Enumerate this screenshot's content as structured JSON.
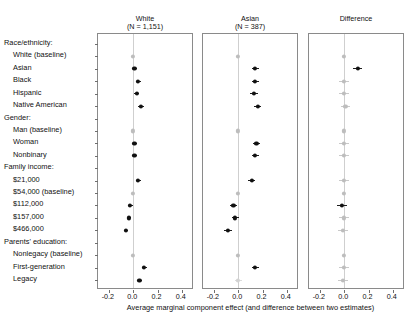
{
  "figure": {
    "x_axis_caption": "Average marginal component effect (and difference between two estimates)",
    "x_ticks": [
      "-0.2",
      "0.0",
      "0.2",
      "0.4"
    ],
    "x_tick_values": [
      -0.2,
      0.0,
      0.2,
      0.4
    ],
    "colors": {
      "dark_estimate": "#111111",
      "light_estimate": "#bdbdbd",
      "panel_border": "#8a8a8a",
      "zero_line": "#cfcfcf",
      "background": "#ffffff"
    }
  },
  "panels": [
    {
      "title_main": "White",
      "title_sub": "(N = 1,151)"
    },
    {
      "title_main": "Asian",
      "title_sub": "(N = 387)"
    },
    {
      "title_main": "Difference",
      "title_sub": ""
    }
  ],
  "rows": [
    {
      "label": "Race/ethnicity:",
      "type": "header"
    },
    {
      "label": "White (baseline)",
      "type": "item"
    },
    {
      "label": "Asian",
      "type": "item"
    },
    {
      "label": "Black",
      "type": "item"
    },
    {
      "label": "Hispanic",
      "type": "item"
    },
    {
      "label": "Native American",
      "type": "item"
    },
    {
      "label": "Gender:",
      "type": "header"
    },
    {
      "label": "Man (baseline)",
      "type": "item"
    },
    {
      "label": "Woman",
      "type": "item"
    },
    {
      "label": "Nonbinary",
      "type": "item"
    },
    {
      "label": "Family income:",
      "type": "header"
    },
    {
      "label": "$21,000",
      "type": "item"
    },
    {
      "label": "$54,000 (baseline)",
      "type": "item"
    },
    {
      "label": "$112,000",
      "type": "item"
    },
    {
      "label": "$157,000",
      "type": "item"
    },
    {
      "label": "$466,000",
      "type": "item"
    },
    {
      "label": "Parents' education:",
      "type": "header"
    },
    {
      "label": "Nonlegacy (baseline)",
      "type": "item"
    },
    {
      "label": "First-generation",
      "type": "item"
    },
    {
      "label": "Legacy",
      "type": "item"
    }
  ],
  "chart_data": {
    "type": "scatter",
    "title": "",
    "xlabel": "Average marginal component effect (and difference between two estimates)",
    "ylabel": "",
    "xlim": [
      -0.29,
      0.5
    ],
    "xticks": [
      -0.2,
      0.0,
      0.2,
      0.4
    ],
    "grid": false,
    "legend": "none",
    "categories": [
      "Race/ethnicity:",
      "White (baseline)",
      "Asian",
      "Black",
      "Hispanic",
      "Native American",
      "Gender:",
      "Man (baseline)",
      "Woman",
      "Nonbinary",
      "Family income:",
      "$21,000",
      "$54,000 (baseline)",
      "$112,000",
      "$157,000",
      "$466,000",
      "Parents' education:",
      "Nonlegacy (baseline)",
      "First-generation",
      "Legacy"
    ],
    "series": [
      {
        "name": "White (N = 1,151)",
        "panel": 0,
        "points": [
          {
            "category": "Race/ethnicity:",
            "value": null,
            "ci_low": null,
            "ci_high": null,
            "style": "none"
          },
          {
            "category": "White (baseline)",
            "value": 0.0,
            "ci_low": 0.0,
            "ci_high": 0.0,
            "style": "light"
          },
          {
            "category": "Asian",
            "value": 0.01,
            "ci_low": -0.01,
            "ci_high": 0.03,
            "style": "dark"
          },
          {
            "category": "Black",
            "value": 0.04,
            "ci_low": 0.02,
            "ci_high": 0.06,
            "style": "dark"
          },
          {
            "category": "Hispanic",
            "value": 0.03,
            "ci_low": 0.01,
            "ci_high": 0.05,
            "style": "dark"
          },
          {
            "category": "Native American",
            "value": 0.06,
            "ci_low": 0.04,
            "ci_high": 0.09,
            "style": "dark"
          },
          {
            "category": "Gender:",
            "value": null,
            "ci_low": null,
            "ci_high": null,
            "style": "none"
          },
          {
            "category": "Man (baseline)",
            "value": 0.0,
            "ci_low": 0.0,
            "ci_high": 0.0,
            "style": "light"
          },
          {
            "category": "Woman",
            "value": 0.01,
            "ci_low": -0.01,
            "ci_high": 0.03,
            "style": "dark"
          },
          {
            "category": "Nonbinary",
            "value": 0.01,
            "ci_low": -0.01,
            "ci_high": 0.03,
            "style": "dark"
          },
          {
            "category": "Family income:",
            "value": null,
            "ci_low": null,
            "ci_high": null,
            "style": "none"
          },
          {
            "category": "$21,000",
            "value": 0.04,
            "ci_low": 0.02,
            "ci_high": 0.06,
            "style": "dark"
          },
          {
            "category": "$54,000 (baseline)",
            "value": 0.0,
            "ci_low": 0.0,
            "ci_high": 0.0,
            "style": "light"
          },
          {
            "category": "$112,000",
            "value": -0.025,
            "ci_low": -0.045,
            "ci_high": -0.005,
            "style": "dark"
          },
          {
            "category": "$157,000",
            "value": -0.035,
            "ci_low": -0.055,
            "ci_high": -0.015,
            "style": "dark"
          },
          {
            "category": "$466,000",
            "value": -0.06,
            "ci_low": -0.08,
            "ci_high": -0.04,
            "style": "dark"
          },
          {
            "category": "Parents' education:",
            "value": null,
            "ci_low": null,
            "ci_high": null,
            "style": "none"
          },
          {
            "category": "Nonlegacy (baseline)",
            "value": 0.0,
            "ci_low": 0.0,
            "ci_high": 0.0,
            "style": "light"
          },
          {
            "category": "First-generation",
            "value": 0.09,
            "ci_low": 0.07,
            "ci_high": 0.11,
            "style": "dark"
          },
          {
            "category": "Legacy",
            "value": 0.05,
            "ci_low": 0.03,
            "ci_high": 0.07,
            "style": "dark"
          }
        ]
      },
      {
        "name": "Asian (N = 387)",
        "panel": 1,
        "points": [
          {
            "category": "Race/ethnicity:",
            "value": null,
            "ci_low": null,
            "ci_high": null,
            "style": "none"
          },
          {
            "category": "White (baseline)",
            "value": 0.0,
            "ci_low": 0.0,
            "ci_high": 0.0,
            "style": "light"
          },
          {
            "category": "Asian",
            "value": 0.14,
            "ci_low": 0.11,
            "ci_high": 0.17,
            "style": "dark"
          },
          {
            "category": "Black",
            "value": 0.14,
            "ci_low": 0.11,
            "ci_high": 0.17,
            "style": "dark"
          },
          {
            "category": "Hispanic",
            "value": 0.13,
            "ci_low": 0.1,
            "ci_high": 0.16,
            "style": "dark"
          },
          {
            "category": "Native American",
            "value": 0.16,
            "ci_low": 0.13,
            "ci_high": 0.19,
            "style": "dark"
          },
          {
            "category": "Gender:",
            "value": null,
            "ci_low": null,
            "ci_high": null,
            "style": "none"
          },
          {
            "category": "Man (baseline)",
            "value": 0.0,
            "ci_low": 0.0,
            "ci_high": 0.0,
            "style": "light"
          },
          {
            "category": "Woman",
            "value": 0.15,
            "ci_low": 0.12,
            "ci_high": 0.18,
            "style": "dark"
          },
          {
            "category": "Nonbinary",
            "value": 0.14,
            "ci_low": 0.11,
            "ci_high": 0.17,
            "style": "dark"
          },
          {
            "category": "Family income:",
            "value": null,
            "ci_low": null,
            "ci_high": null,
            "style": "none"
          },
          {
            "category": "$21,000",
            "value": 0.11,
            "ci_low": 0.08,
            "ci_high": 0.14,
            "style": "dark"
          },
          {
            "category": "$54,000 (baseline)",
            "value": 0.0,
            "ci_low": 0.0,
            "ci_high": 0.0,
            "style": "light"
          },
          {
            "category": "$112,000",
            "value": -0.04,
            "ci_low": -0.07,
            "ci_high": -0.01,
            "style": "dark"
          },
          {
            "category": "$157,000",
            "value": -0.025,
            "ci_low": -0.055,
            "ci_high": 0.005,
            "style": "dark"
          },
          {
            "category": "$466,000",
            "value": -0.085,
            "ci_low": -0.115,
            "ci_high": -0.055,
            "style": "dark"
          },
          {
            "category": "Parents' education:",
            "value": null,
            "ci_low": null,
            "ci_high": null,
            "style": "none"
          },
          {
            "category": "Nonlegacy (baseline)",
            "value": 0.0,
            "ci_low": 0.0,
            "ci_high": 0.0,
            "style": "light"
          },
          {
            "category": "First-generation",
            "value": 0.14,
            "ci_low": 0.11,
            "ci_high": 0.17,
            "style": "dark"
          },
          {
            "category": "Legacy",
            "value": 0.0,
            "ci_low": -0.03,
            "ci_high": 0.03,
            "style": "faint"
          }
        ]
      },
      {
        "name": "Difference",
        "panel": 2,
        "points": [
          {
            "category": "Race/ethnicity:",
            "value": null,
            "ci_low": null,
            "ci_high": null,
            "style": "none"
          },
          {
            "category": "White (baseline)",
            "value": 0.0,
            "ci_low": 0.0,
            "ci_high": 0.0,
            "style": "light"
          },
          {
            "category": "Asian",
            "value": 0.11,
            "ci_low": 0.07,
            "ci_high": 0.15,
            "style": "dark"
          },
          {
            "category": "Black",
            "value": 0.0,
            "ci_low": -0.04,
            "ci_high": 0.04,
            "style": "light"
          },
          {
            "category": "Hispanic",
            "value": 0.0,
            "ci_low": -0.04,
            "ci_high": 0.04,
            "style": "light"
          },
          {
            "category": "Native American",
            "value": 0.01,
            "ci_low": -0.03,
            "ci_high": 0.05,
            "style": "light"
          },
          {
            "category": "Gender:",
            "value": null,
            "ci_low": null,
            "ci_high": null,
            "style": "none"
          },
          {
            "category": "Man (baseline)",
            "value": 0.0,
            "ci_low": 0.0,
            "ci_high": 0.0,
            "style": "light"
          },
          {
            "category": "Woman",
            "value": 0.0,
            "ci_low": -0.04,
            "ci_high": 0.04,
            "style": "light"
          },
          {
            "category": "Nonbinary",
            "value": 0.0,
            "ci_low": -0.04,
            "ci_high": 0.04,
            "style": "light"
          },
          {
            "category": "Family income:",
            "value": null,
            "ci_low": null,
            "ci_high": null,
            "style": "none"
          },
          {
            "category": "$21,000",
            "value": 0.0,
            "ci_low": -0.04,
            "ci_high": 0.04,
            "style": "light"
          },
          {
            "category": "$54,000 (baseline)",
            "value": 0.0,
            "ci_low": 0.0,
            "ci_high": 0.0,
            "style": "light"
          },
          {
            "category": "$112,000",
            "value": -0.02,
            "ci_low": -0.06,
            "ci_high": 0.02,
            "style": "dark"
          },
          {
            "category": "$157,000",
            "value": 0.0,
            "ci_low": -0.04,
            "ci_high": 0.04,
            "style": "light"
          },
          {
            "category": "$466,000",
            "value": -0.01,
            "ci_low": -0.05,
            "ci_high": 0.03,
            "style": "light"
          },
          {
            "category": "Parents' education:",
            "value": null,
            "ci_low": null,
            "ci_high": null,
            "style": "none"
          },
          {
            "category": "Nonlegacy (baseline)",
            "value": 0.0,
            "ci_low": 0.0,
            "ci_high": 0.0,
            "style": "light"
          },
          {
            "category": "First-generation",
            "value": 0.0,
            "ci_low": -0.04,
            "ci_high": 0.04,
            "style": "light"
          },
          {
            "category": "Legacy",
            "value": -0.01,
            "ci_low": -0.05,
            "ci_high": 0.03,
            "style": "light"
          }
        ]
      }
    ]
  }
}
